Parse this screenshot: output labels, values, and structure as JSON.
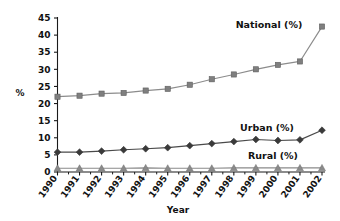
{
  "chart_data": {
    "type": "line",
    "title": "",
    "xlabel": "Year",
    "ylabel": "%",
    "categories": [
      "1990",
      "1991",
      "1992",
      "1993",
      "1994",
      "1995",
      "1996",
      "1997",
      "1998",
      "1999",
      "2000",
      "2001",
      "2002"
    ],
    "x": [
      1990,
      1991,
      1992,
      1993,
      1994,
      1995,
      1996,
      1997,
      1998,
      1999,
      2000,
      2001,
      2002
    ],
    "ylim": [
      0,
      45
    ],
    "xlim": [
      1990,
      2002
    ],
    "yticks": [
      "0",
      "5",
      "10",
      "15",
      "20",
      "25",
      "30",
      "35",
      "40",
      "45"
    ],
    "ytick_values": [
      0,
      5,
      10,
      15,
      20,
      25,
      30,
      35,
      40,
      45
    ],
    "grid": false,
    "legend_position": "inline-annotations",
    "series": [
      {
        "name": "National (%)",
        "marker": "square",
        "color": "#7f7f7f",
        "line_color": "#8c8c8c",
        "values": [
          22.0,
          22.3,
          22.9,
          23.1,
          23.8,
          24.3,
          25.5,
          27.1,
          28.5,
          30.0,
          31.3,
          32.3,
          42.5
        ]
      },
      {
        "name": "Urban (%)",
        "marker": "diamond",
        "color": "#3a3a3a",
        "line_color": "#4a4a4a",
        "values": [
          5.8,
          5.8,
          6.1,
          6.5,
          6.8,
          7.1,
          7.7,
          8.3,
          8.9,
          9.5,
          9.2,
          9.4,
          12.2
        ]
      },
      {
        "name": "Rural (%)",
        "marker": "triangle",
        "color": "#8a8a8a",
        "line_color": "#8a8a8a",
        "values": [
          1.1,
          1.1,
          1.1,
          1.1,
          1.2,
          1.1,
          1.1,
          1.1,
          1.2,
          1.2,
          1.2,
          1.2,
          1.2
        ]
      }
    ],
    "annotations": [
      {
        "text": "National (%)",
        "series": "National (%)"
      },
      {
        "text": "Urban (%)",
        "series": "Urban (%)"
      },
      {
        "text": "Rural (%)",
        "series": "Rural (%)"
      }
    ]
  },
  "axis": {
    "y_title": "%",
    "x_title": "Year"
  },
  "ticks": {
    "y": [
      "45",
      "40",
      "35",
      "30",
      "25",
      "20",
      "15",
      "10",
      "5",
      "0"
    ],
    "x": [
      "1990",
      "1991",
      "1992",
      "1993",
      "1994",
      "1995",
      "1996",
      "1997",
      "1998",
      "1999",
      "2000",
      "2001",
      "2002"
    ]
  },
  "labels": {
    "national": "National (%)",
    "urban": "Urban (%)",
    "rural": "Rural (%)"
  },
  "colors": {
    "national": "#7f7f7f",
    "urban": "#3a3a3a",
    "rural": "#8a8a8a",
    "axis": "#1a1a1a",
    "background": "#ffffff"
  }
}
